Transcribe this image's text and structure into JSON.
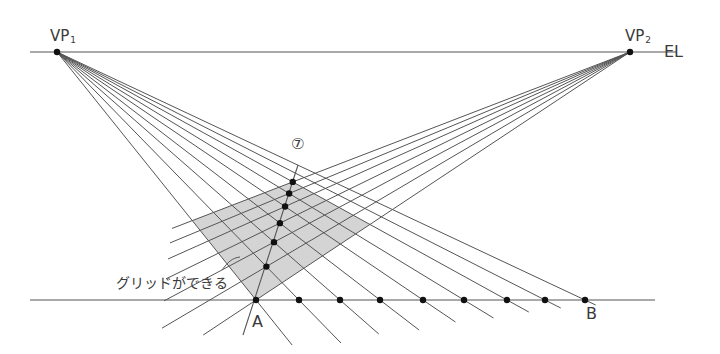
{
  "labels": {
    "vp1": "VP",
    "vp1_sub": "1",
    "vp2": "VP",
    "vp2_sub": "2",
    "eye_level": "EL",
    "point_a": "A",
    "point_b": "B",
    "step": "⑦",
    "grid_note": "グリッドができる"
  },
  "geometry": {
    "eye_level_y": 52,
    "eye_level_x": [
      30,
      676
    ],
    "ground_y": 300,
    "ground_x": [
      30,
      655
    ],
    "vp1": [
      57,
      52
    ],
    "vp2": [
      630,
      52
    ],
    "ground_points_x": [
      256,
      299,
      340,
      380,
      423,
      464,
      507,
      545,
      585
    ],
    "vp1_line_end_y": [
      345,
      343,
      334,
      330,
      322,
      318,
      312,
      308,
      305
    ],
    "diagonal_through": [
      298,
      165
    ],
    "diagonal_bottom": [
      243,
      335
    ],
    "grid_cells": 6,
    "vp2_left_end_x": 160,
    "colors": {
      "line": "#555555",
      "grid_fill": "#d4d4d4",
      "dot": "#111111",
      "text": "#3a3a3a"
    }
  }
}
